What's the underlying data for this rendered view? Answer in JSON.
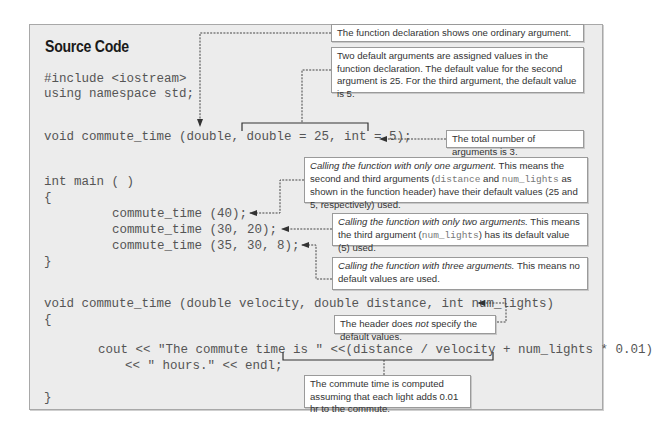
{
  "title": "Source Code",
  "code": {
    "include": "#include <iostream>",
    "using": "using namespace std;",
    "prototype": "void commute_time (double, double = 25, int = 5);",
    "main_sig": "int main ( )",
    "open1": "{",
    "call1": "commute_time (40);",
    "call2": "commute_time (30, 20);",
    "call3": "commute_time (35, 30, 8);",
    "close1": "}",
    "header": "void commute_time (double velocity, double distance, int num_lights)",
    "open2": "{",
    "cout1": "cout << \"The commute time is \" <<(distance / velocity + num_lights * 0.01)",
    "cout2": "<< \" hours.\" << endl;",
    "close2": "}"
  },
  "notes": {
    "n1": "The function declaration shows one ordinary argument.",
    "n2": "Two default arguments are assigned values in the function declaration. The default value for the second argument is 25. For the third argument, the default value is 5.",
    "n3": "The total number of arguments is 3.",
    "n4": {
      "italic": "Calling the function with only one argument.",
      "rest1": " This means the second and third arguments (",
      "mono1": "distance",
      "rest2": " and ",
      "mono2": "num_lights",
      "rest3": " as shown in the function header) have their default values (25 and 5, respectively) used."
    },
    "n5": {
      "italic": "Calling the function with only two arguments.",
      "rest1": " This means the third argument (",
      "mono1": "num_lights",
      "rest2": ") has its default value (5) used."
    },
    "n6": {
      "italic": "Calling the function with three arguments.",
      "rest1": " This means no default values are used."
    },
    "n7": {
      "pre": "The header does ",
      "italic": "not",
      "post": " specify the default values."
    },
    "n8": "The commute time is computed assuming that each light adds 0.01 hr to the commute."
  }
}
